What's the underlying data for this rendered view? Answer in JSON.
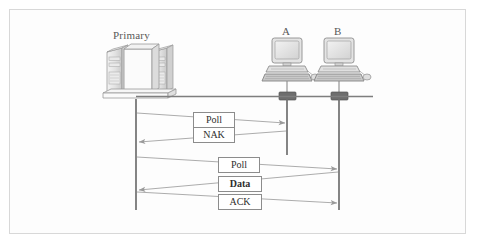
{
  "figure": {
    "background_color": "#fdfdfd",
    "border_color": "#d8d8d8",
    "line_color": "#8a8a8a",
    "lifeline_color": "#777777",
    "device_color": "#a8a8a8"
  },
  "nodes": [
    {
      "id": "primary",
      "label": "Primary",
      "type": "server-stack",
      "x": 136,
      "label_x": 113,
      "label_y": 29
    },
    {
      "id": "a",
      "label": "A",
      "type": "workstation",
      "x": 287,
      "label_x": 282,
      "label_y": 25
    },
    {
      "id": "b",
      "label": "B",
      "type": "workstation",
      "x": 339,
      "label_x": 334,
      "label_y": 25
    }
  ],
  "bus": {
    "name": "network-bus",
    "y": 97,
    "x_start": 136,
    "x_end": 373,
    "connector_color": "#6e6e6e"
  },
  "lifelines": [
    {
      "node": "primary",
      "x": 136,
      "y_top": 99,
      "y_bottom": 210
    },
    {
      "node": "a",
      "x": 287,
      "y_top": 99,
      "y_bottom": 155
    },
    {
      "node": "b",
      "x": 339,
      "y_top": 99,
      "y_bottom": 210
    }
  ],
  "messages": [
    {
      "index": 0,
      "label": "Poll",
      "bold": false,
      "from": "primary",
      "to": "a",
      "direction": "right",
      "x1": 136,
      "y1": 113,
      "x2": 287,
      "y2": 123,
      "box": {
        "left": 193,
        "top": 112,
        "width": 42,
        "height": 14
      }
    },
    {
      "index": 1,
      "label": "NAK",
      "bold": false,
      "from": "a",
      "to": "primary",
      "direction": "left",
      "x1": 287,
      "y1": 131,
      "x2": 136,
      "y2": 142,
      "box": {
        "left": 193,
        "top": 127,
        "width": 42,
        "height": 14
      }
    },
    {
      "index": 2,
      "label": "Poll",
      "bold": false,
      "from": "primary",
      "to": "b",
      "direction": "right",
      "x1": 136,
      "y1": 157,
      "x2": 339,
      "y2": 169,
      "box": {
        "left": 218,
        "top": 157,
        "width": 42,
        "height": 14
      }
    },
    {
      "index": 3,
      "label": "Data",
      "bold": true,
      "from": "b",
      "to": "primary",
      "direction": "left",
      "x1": 339,
      "y1": 172,
      "x2": 136,
      "y2": 190,
      "box": {
        "left": 218,
        "top": 176,
        "width": 44,
        "height": 14
      }
    },
    {
      "index": 4,
      "label": "ACK",
      "bold": false,
      "from": "primary",
      "to": "b",
      "direction": "right",
      "x1": 136,
      "y1": 192,
      "x2": 339,
      "y2": 203,
      "box": {
        "left": 218,
        "top": 194,
        "width": 44,
        "height": 14
      }
    }
  ]
}
